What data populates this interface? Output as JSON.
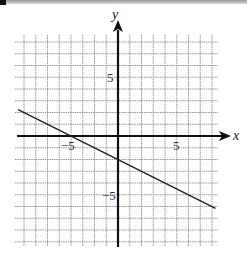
{
  "chart_data": {
    "type": "line",
    "title": "",
    "xlabel": "x",
    "ylabel": "y",
    "xlim": [
      -8.5,
      8.5
    ],
    "ylim": [
      -9,
      8
    ],
    "grid": true,
    "grid_step": 1,
    "tick_labels": {
      "x": [
        {
          "value": -5,
          "label": "−5"
        },
        {
          "value": 5,
          "label": "5"
        }
      ],
      "y": [
        {
          "value": 5,
          "label": "5"
        },
        {
          "value": -5,
          "label": "−5"
        }
      ]
    },
    "series": [
      {
        "name": "line",
        "equation": "y = -x/2 - 2",
        "slope": -0.5,
        "y_intercept": -2,
        "x_intercept": -4,
        "x": [
          -8.5,
          8.3
        ],
        "y": [
          2.25,
          -6.15
        ]
      }
    ]
  },
  "labels": {
    "x_axis": "x",
    "y_axis": "y",
    "x_neg5": "−5",
    "x_pos5": "5",
    "y_pos5": "5",
    "y_neg5": "−5"
  },
  "colors": {
    "grid": "#8a8a8a",
    "axes": "#111111",
    "line": "#222222"
  }
}
